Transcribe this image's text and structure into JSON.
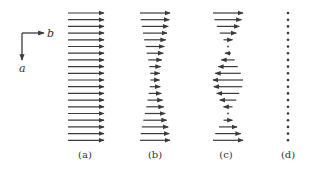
{
  "figure": {
    "background": "#ffffff",
    "ink_color": "#3a3a3a",
    "axes": {
      "horizontal_label": "b",
      "vertical_label": "a",
      "origin": [
        22,
        33
      ],
      "horizontal_end": [
        44,
        33
      ],
      "vertical_end": [
        22,
        60
      ]
    },
    "row_count": 20,
    "row_y_start": 13,
    "row_y_step": 6.7,
    "panels": [
      {
        "id": "a",
        "label": "(a)",
        "label_x": 85,
        "center_x": 86,
        "mode": "uniform",
        "magnitudes": [
          1,
          1,
          1,
          1,
          1,
          1,
          1,
          1,
          1,
          1,
          1,
          1,
          1,
          1,
          1,
          1,
          1,
          1,
          1,
          1
        ],
        "max_length": 36
      },
      {
        "id": "b",
        "label": "(b)",
        "label_x": 155,
        "center_x": 155,
        "mode": "varying-positive",
        "magnitudes": [
          1.0,
          0.95,
          0.88,
          0.8,
          0.72,
          0.62,
          0.55,
          0.45,
          0.38,
          0.32,
          0.3,
          0.35,
          0.42,
          0.5,
          0.58,
          0.68,
          0.78,
          0.88,
          0.95,
          1.0
        ],
        "max_length": 30
      },
      {
        "id": "c",
        "label": "(c)",
        "label_x": 226,
        "center_x": 228,
        "mode": "signed",
        "magnitudes": [
          1.0,
          0.9,
          0.75,
          0.55,
          0.3,
          0.05,
          -0.2,
          -0.45,
          -0.65,
          -0.85,
          -1.0,
          -0.95,
          -0.75,
          -0.55,
          -0.3,
          -0.05,
          0.3,
          0.6,
          0.85,
          1.0
        ],
        "max_length": 30
      },
      {
        "id": "d",
        "label": "(d)",
        "label_x": 288,
        "center_x": 288,
        "mode": "dots",
        "magnitudes": [
          0,
          0,
          0,
          0,
          0,
          0,
          0,
          0,
          0,
          0,
          0,
          0,
          0,
          0,
          0,
          0,
          0,
          0,
          0,
          0
        ],
        "max_length": 0
      }
    ],
    "panel_label_y": 158
  }
}
